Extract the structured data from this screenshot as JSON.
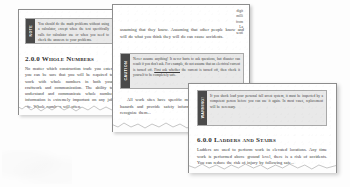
{
  "scan": {
    "background_color": "#fdfdfd",
    "page_color": "#ffffff",
    "callout_fill": "#e9e9e9",
    "callout_tab_color": "#4a4a4a",
    "text_color": "#3a3a3a"
  },
  "page1": {
    "note": {
      "tab_label": "NOTE",
      "text": "You should do the math problems without using a calculator, except when the text specifically calls for calculator use or when you need to check the answers to your problems."
    },
    "heading": "2.0.0 Whole Numbers",
    "body": "No matter which construction trade you enter, you can be sure that you will be required to work with whole numbers in both your craftwork and communication. The ability to understand and communicate whole number information is extremely important on any job site. Whole numbers will often..."
  },
  "page2": {
    "fragment_lines": [
      "digit",
      "milli",
      "from",
      "La",
      "senti"
    ],
    "body_top": "assuming that they know. Assuming that other people know and will do what you think they will do can cause accidents.",
    "caution": {
      "tab_label": "CAUTION",
      "text_before_underline": "Never assume anything! It never hurts to ask questions, but disaster can result if you don't ask. For example, do not assume that an electrical current is turned off. ",
      "text_underlined": "First ask whether",
      "text_after_underline": " the current is turned off, then check it yourself to be completely safe."
    },
    "body_bottom": "All work sites have specific markings and signs to identify hazards and provide safety information (Figure 3). Learn to recognize them..."
  },
  "page3": {
    "warning": {
      "tab_label": "WARNING!",
      "text": "If you shock load your personal fall arrest system, it must be inspected by a competent person before you can use it again. In most cases, replacement will be necessary."
    },
    "heading": "6.0.0 Ladders and Stairs",
    "body": "Ladders are used to perform work in elevated locations. Any time work is performed above ground level, there is a risk of accidents. You can reduce the risk of injury by following safe..."
  }
}
